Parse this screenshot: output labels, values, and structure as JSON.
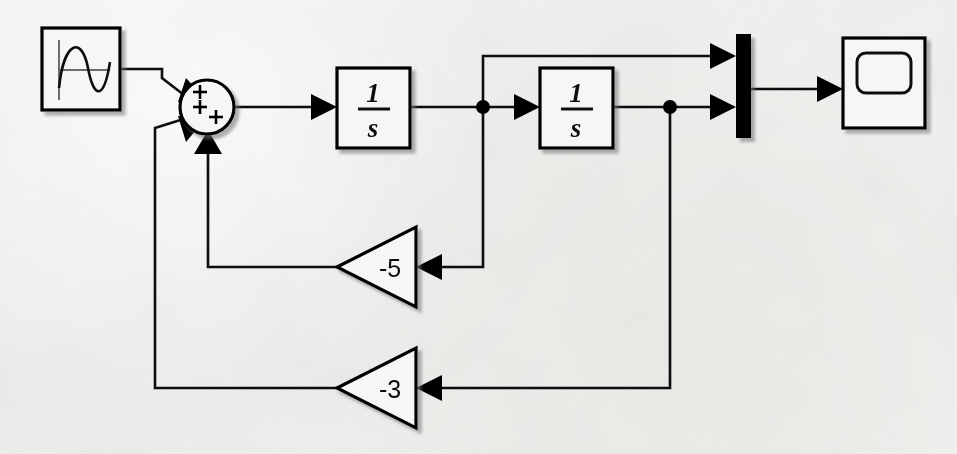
{
  "diagram": {
    "background_color": "#f2f1ef",
    "line_color": "#111111",
    "block_fill": "#f7f6f4",
    "blocks": [
      {
        "id": "sine-source",
        "name": "sine-wave-source-block",
        "kind": "source",
        "icon": "sine-wave-icon",
        "label": "",
        "x": 42,
        "y": 28,
        "width": 78,
        "height": 82
      },
      {
        "id": "sum",
        "name": "sum-block",
        "kind": "sum",
        "icon": "sum-circle-icon",
        "signs": [
          "+",
          "+",
          "+"
        ],
        "label": "",
        "cx": 207,
        "cy": 107,
        "r": 27
      },
      {
        "id": "integrator-1",
        "name": "integrator-block-1",
        "kind": "transfer-function",
        "numerator": "1",
        "denominator": "s",
        "label": "1/s",
        "x": 337,
        "y": 68,
        "width": 73,
        "height": 80
      },
      {
        "id": "integrator-2",
        "name": "integrator-block-2",
        "kind": "transfer-function",
        "numerator": "1",
        "denominator": "s",
        "label": "1/s",
        "x": 540,
        "y": 68,
        "width": 73,
        "height": 80
      },
      {
        "id": "gain-minus-5",
        "name": "gain-block-minus-5",
        "kind": "gain",
        "label": "-5",
        "tip_x": 337,
        "base_x": 416,
        "cy": 267,
        "half_height": 40
      },
      {
        "id": "gain-minus-3",
        "name": "gain-block-minus-3",
        "kind": "gain",
        "label": "-3",
        "tip_x": 337,
        "base_x": 416,
        "cy": 388,
        "half_height": 40
      },
      {
        "id": "mux",
        "name": "mux-block",
        "kind": "mux",
        "label": "",
        "x": 736,
        "y": 34,
        "width": 15,
        "height": 104
      },
      {
        "id": "scope",
        "name": "scope-block",
        "kind": "sink",
        "icon": "scope-screen-icon",
        "label": "",
        "x": 843,
        "y": 38,
        "width": 82,
        "height": 90
      }
    ],
    "signals": [
      {
        "name": "signal-source-to-sum",
        "from": "sine-source",
        "to": "sum",
        "port": "input-1"
      },
      {
        "name": "signal-sum-to-integrator-1",
        "from": "sum",
        "to": "integrator-1"
      },
      {
        "name": "signal-integrator-1-to-integrator-2",
        "from": "integrator-1",
        "to": "integrator-2"
      },
      {
        "name": "signal-branch-to-mux-top",
        "from": "integrator-1",
        "to": "mux",
        "port": "input-1"
      },
      {
        "name": "signal-branch-to-gain-minus-5",
        "from": "integrator-1",
        "to": "gain-minus-5"
      },
      {
        "name": "signal-integrator-2-to-mux-bottom",
        "from": "integrator-2",
        "to": "mux",
        "port": "input-2"
      },
      {
        "name": "signal-branch-to-gain-minus-3",
        "from": "integrator-2",
        "to": "gain-minus-3"
      },
      {
        "name": "signal-gain-minus-5-to-sum",
        "from": "gain-minus-5",
        "to": "sum",
        "port": "input-3"
      },
      {
        "name": "signal-gain-minus-3-to-sum",
        "from": "gain-minus-3",
        "to": "sum",
        "port": "input-2"
      },
      {
        "name": "signal-mux-to-scope",
        "from": "mux",
        "to": "scope"
      }
    ],
    "junctions": [
      {
        "name": "junction-after-integrator-1",
        "x": 483,
        "y": 107
      },
      {
        "name": "junction-after-integrator-2",
        "x": 670,
        "y": 107
      }
    ]
  }
}
